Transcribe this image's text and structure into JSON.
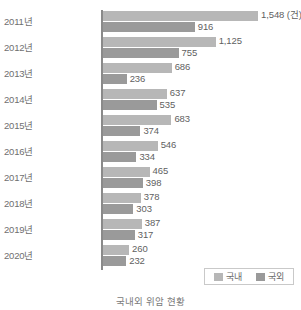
{
  "chart_data": {
    "type": "bar",
    "orientation": "horizontal",
    "title": "",
    "caption": "국내외 위암 현황",
    "unit_label": "(건)",
    "xlabel": "",
    "ylabel": "",
    "grid": false,
    "legend_position": "bottom-right",
    "xlim": [
      0,
      1548
    ],
    "categories": [
      "2011년",
      "2012년",
      "2013년",
      "2014년",
      "2015년",
      "2016년",
      "2017년",
      "2018년",
      "2019년",
      "2020년"
    ],
    "series": [
      {
        "name": "국내",
        "values": [
          1548,
          1125,
          686,
          637,
          683,
          546,
          465,
          378,
          387,
          260
        ],
        "labels": [
          "1,548 (건)",
          "1,125",
          "686",
          "637",
          "683",
          "546",
          "465",
          "378",
          "387",
          "260"
        ],
        "color": "#b7b7b7"
      },
      {
        "name": "국외",
        "values": [
          916,
          755,
          236,
          535,
          374,
          334,
          398,
          303,
          317,
          232
        ],
        "labels": [
          "916",
          "755",
          "236",
          "535",
          "374",
          "334",
          "398",
          "303",
          "317",
          "232"
        ],
        "color": "#9a9a9a"
      }
    ]
  },
  "legend": {
    "items": [
      {
        "label": "국내",
        "color": "#b7b7b7"
      },
      {
        "label": "국외",
        "color": "#9a9a9a"
      }
    ]
  },
  "axis": {
    "line_color": "#8a8a8a"
  }
}
